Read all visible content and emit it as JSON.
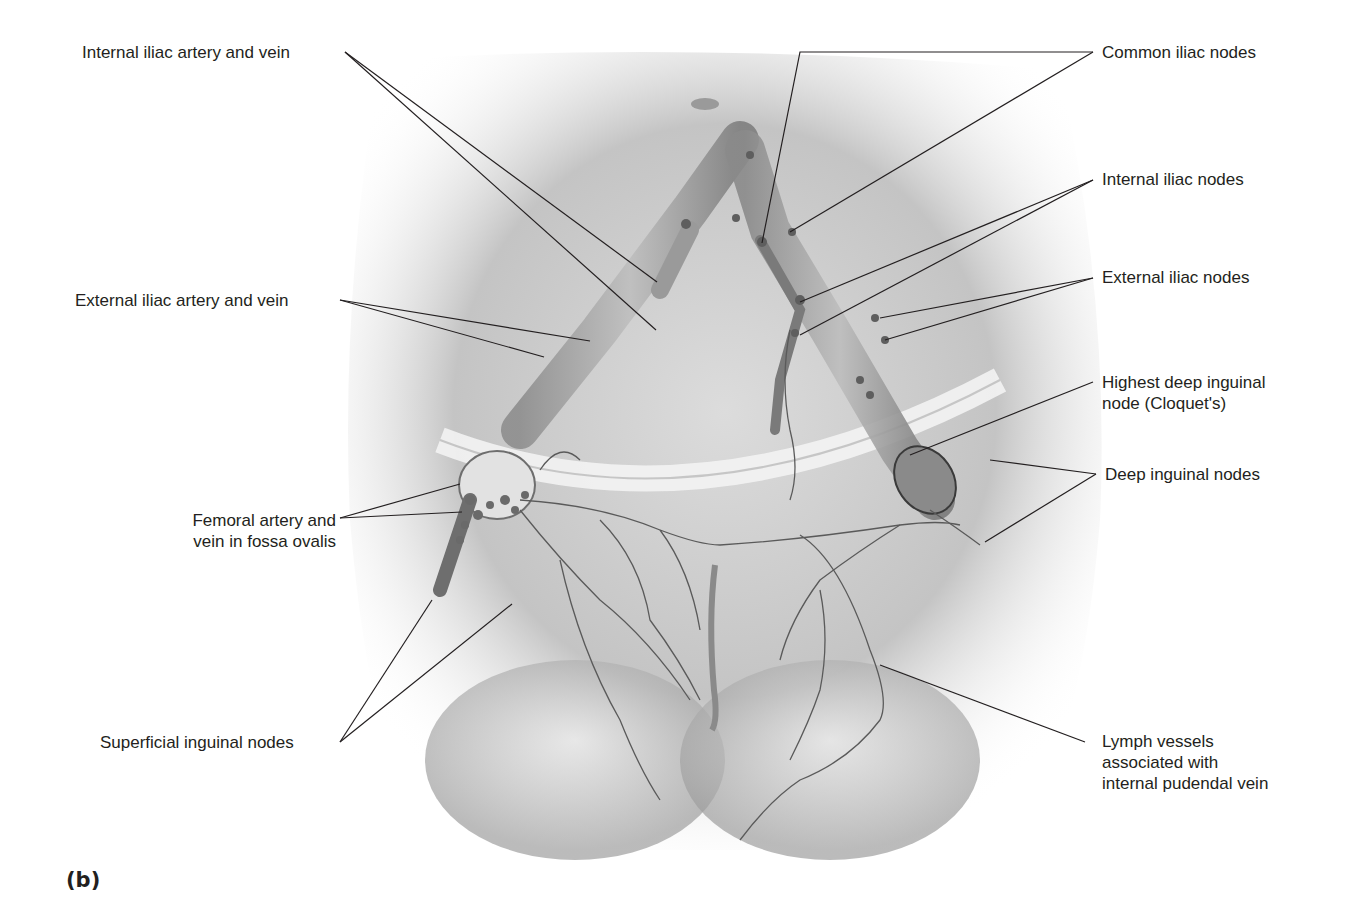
{
  "figure": {
    "panel_label": "(b)",
    "colors": {
      "background": "#ffffff",
      "label_text": "#231f20",
      "leader_line": "#231f20",
      "body_shading": "#9a9a9a",
      "vessel": "#6e6e6e"
    }
  },
  "labels": {
    "left": [
      {
        "id": "internal-iliac-artery-vein",
        "text": "Internal iliac artery and vein"
      },
      {
        "id": "external-iliac-artery-vein",
        "text": "External iliac artery and vein"
      },
      {
        "id": "femoral-artery-vein",
        "lines": [
          "Femoral artery and",
          "vein in fossa ovalis"
        ]
      },
      {
        "id": "superficial-inguinal-nodes",
        "text": "Superficial inguinal nodes"
      }
    ],
    "right": [
      {
        "id": "common-iliac-nodes",
        "text": "Common iliac nodes"
      },
      {
        "id": "internal-iliac-nodes",
        "text": "Internal iliac nodes"
      },
      {
        "id": "external-iliac-nodes",
        "text": "External iliac nodes"
      },
      {
        "id": "highest-deep-inguinal-node",
        "lines": [
          "Highest deep inguinal",
          "node (Cloquet's)"
        ]
      },
      {
        "id": "deep-inguinal-nodes",
        "text": "Deep inguinal nodes"
      },
      {
        "id": "lymph-vessels-pudendal",
        "lines": [
          "Lymph vessels",
          "associated with",
          "internal pudendal vein"
        ]
      }
    ]
  }
}
